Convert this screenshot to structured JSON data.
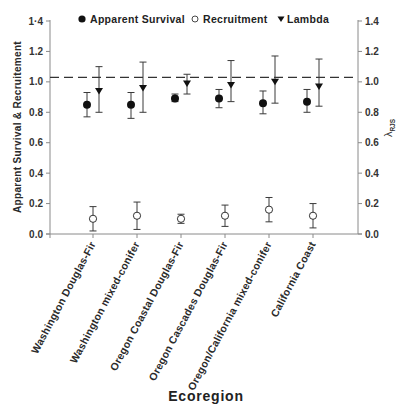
{
  "chart_data": {
    "type": "scatter",
    "subtype": "point-with-error-bars, dual y-axis",
    "title": "",
    "xlabel": "Ecoregion",
    "ylabel": "Apparent Survival & Recruitement",
    "y2label": "λ RJS",
    "ylim": [
      0.0,
      1.4
    ],
    "y2lim": [
      0.0,
      1.4
    ],
    "yticks": [
      "0.0",
      "0.2",
      "0.4",
      "0.6",
      "0.8",
      "1.0",
      "1.2",
      "1·4"
    ],
    "y2ticks": [
      "0.0",
      "0.2",
      "0.4",
      "0.6",
      "0.8",
      "1.0",
      "1.2",
      "1.4"
    ],
    "grid": false,
    "legend_position": "top",
    "reference_line": {
      "y": 1.03,
      "style": "dashed"
    },
    "categories": [
      "Washington Douglas-Fir",
      "Washington mixed-conifer",
      "Oregon Coastal Douglas-Fir",
      "Oregon Cascades Douglas-Fir",
      "Oregon/California mixed-conifer",
      "California Coast"
    ],
    "series": [
      {
        "name": "Apparent Survival",
        "marker": "filled-circle",
        "axis": "left",
        "values": [
          0.85,
          0.85,
          0.89,
          0.89,
          0.86,
          0.87
        ],
        "lower": [
          0.77,
          0.76,
          0.87,
          0.83,
          0.79,
          0.8
        ],
        "upper": [
          0.93,
          0.93,
          0.92,
          0.95,
          0.94,
          0.95
        ]
      },
      {
        "name": "Recruitment",
        "marker": "open-circle",
        "axis": "left",
        "values": [
          0.1,
          0.12,
          0.1,
          0.12,
          0.16,
          0.12
        ],
        "lower": [
          0.02,
          0.03,
          0.07,
          0.05,
          0.08,
          0.04
        ],
        "upper": [
          0.18,
          0.21,
          0.13,
          0.19,
          0.24,
          0.2
        ]
      },
      {
        "name": "Lambda",
        "marker": "filled-down-triangle",
        "axis": "right",
        "values": [
          0.94,
          0.96,
          0.99,
          0.98,
          1.0,
          0.97
        ],
        "lower": [
          0.8,
          0.8,
          0.92,
          0.87,
          0.86,
          0.84
        ],
        "upper": [
          1.1,
          1.13,
          1.05,
          1.14,
          1.17,
          1.15
        ]
      }
    ]
  },
  "legend": {
    "survival": "Apparent Survival",
    "recruitment": "Recruitment",
    "lambda": "Lambda"
  },
  "axes": {
    "left_title": "Apparent Survival & Recruitement",
    "right_title_symbol": "λ",
    "right_title_sub": "RJS",
    "x_title": "Ecoregion"
  }
}
